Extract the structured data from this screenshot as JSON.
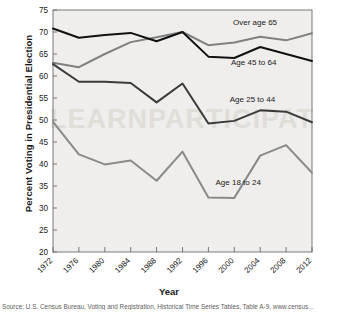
{
  "chart_data": {
    "type": "line",
    "title": "",
    "xlabel": "Year",
    "ylabel": "Percent Voting in Presidential Election",
    "x": [
      1972,
      1976,
      1980,
      1984,
      1988,
      1992,
      1996,
      2000,
      2004,
      2008,
      2012
    ],
    "xtick_labels": [
      "1972",
      "1976",
      "1980",
      "1984",
      "1988",
      "1992",
      "1996",
      "2000",
      "2004",
      "2008",
      "2012"
    ],
    "ytick_labels": [
      "20",
      "25",
      "30",
      "35",
      "40",
      "45",
      "50",
      "55",
      "60",
      "65",
      "70",
      "75"
    ],
    "ylim": [
      20,
      75
    ],
    "xlim": [
      1972,
      2012
    ],
    "ytick_step": 5,
    "grid": false,
    "legend_position": "inline-annotations",
    "series": [
      {
        "name": "Over age 65",
        "color": "#808080",
        "label_x": 2003.2,
        "label_y": 71.6,
        "values": [
          63.0,
          62.0,
          65.0,
          67.7,
          68.8,
          70.0,
          67.0,
          67.6,
          68.9,
          68.1,
          69.7
        ]
      },
      {
        "name": "Age 45 to 64",
        "color": "#111111",
        "label_x": 2003.0,
        "label_y": 62.4,
        "values": [
          70.8,
          68.7,
          69.3,
          69.8,
          67.9,
          70.0,
          64.4,
          64.1,
          66.6,
          65.0,
          63.4
        ]
      },
      {
        "name": "Age 25 to 44",
        "color": "#3a3a3a",
        "label_x": 2002.8,
        "label_y": 54.2,
        "values": [
          62.7,
          58.7,
          58.7,
          58.4,
          54.0,
          58.3,
          49.2,
          49.8,
          52.2,
          51.9,
          49.5
        ]
      },
      {
        "name": "Age 18 to 24",
        "color": "#8a8a8a",
        "label_x": 2000.6,
        "label_y": 35.3,
        "values": [
          49.6,
          42.2,
          39.9,
          40.8,
          36.2,
          42.8,
          32.4,
          32.3,
          41.9,
          44.3,
          38.0
        ]
      }
    ],
    "plot_background": "#efeeec",
    "watermark_text": "LEARNPARTICIPAT"
  },
  "source": {
    "note": "Source: U.S. Census Bureau, Voting and Registration, Historical Time Series Tables, Table A-9, www.census..."
  }
}
